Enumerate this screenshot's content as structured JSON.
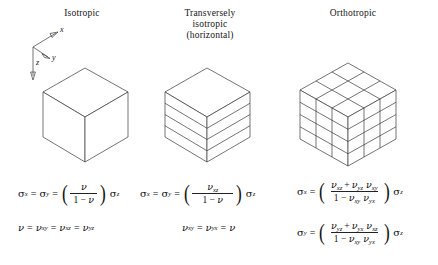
{
  "figure": {
    "columns": [
      {
        "id": "isotropic",
        "title": "Isotropic",
        "cube_style": "solid",
        "equations": [
          {
            "id": "iso-eq1",
            "lhs1": "σ",
            "lhs1_sub": "x",
            "eq1": "=",
            "lhs2": "σ",
            "lhs2_sub": "y",
            "eq2": "=",
            "open_paren": "(",
            "numerator": "ν",
            "numerator_sub": "",
            "denominator_pre": "1 − ",
            "denominator": "ν",
            "denominator_sub": "",
            "close_paren": ")",
            "rhs": "σ",
            "rhs_sub": "z"
          },
          {
            "id": "iso-eq2",
            "text_parts": [
              "ν",
              "=",
              "ν",
              "xy",
              "=",
              "ν",
              "xz",
              "=",
              "ν",
              "yz"
            ]
          }
        ]
      },
      {
        "id": "transversely-isotropic",
        "title": "Transversely\nisotropic\n(horizontal)",
        "title_line1": "Transversely",
        "title_line2": "isotropic",
        "title_line3": "(horizontal)",
        "cube_style": "layered",
        "layers": 4,
        "equations": [
          {
            "id": "trans-eq1",
            "lhs1": "σ",
            "lhs1_sub": "x",
            "eq1": "=",
            "lhs2": "σ",
            "lhs2_sub": "y",
            "eq2": "=",
            "open_paren": "(",
            "numerator": "ν",
            "numerator_sub": "xz",
            "denominator_pre": "1 − ",
            "denominator": "ν",
            "denominator_sub": "",
            "close_paren": ")",
            "rhs": "σ",
            "rhs_sub": "z"
          },
          {
            "id": "trans-eq2",
            "text_parts": [
              "ν",
              "xy",
              "=",
              "ν",
              "yx",
              "=",
              "ν"
            ]
          }
        ]
      },
      {
        "id": "orthotropic",
        "title": "Orthotropic",
        "cube_style": "gridded",
        "equations": [
          {
            "id": "ortho-eq1",
            "lhs1": "σ",
            "lhs1_sub": "x",
            "eq1": "=",
            "open_paren": "(",
            "num_a": "ν",
            "num_a_sub": "xz",
            "num_plus": "+",
            "num_b": "ν",
            "num_b_sub": "yz",
            "num_c": "ν",
            "num_c_sub": "xy",
            "den_pre": "1 − ",
            "den_a": "ν",
            "den_a_sub": "xy",
            "den_b": "ν",
            "den_b_sub": "yx",
            "close_paren": ")",
            "rhs": "σ",
            "rhs_sub": "z"
          },
          {
            "id": "ortho-eq2",
            "lhs1": "σ",
            "lhs1_sub": "y",
            "eq1": "=",
            "open_paren": "(",
            "num_a": "ν",
            "num_a_sub": "yz",
            "num_plus": "+",
            "num_b": "ν",
            "num_b_sub": "yx",
            "num_c": "ν",
            "num_c_sub": "xz",
            "den_pre": "1 − ",
            "den_a": "ν",
            "den_a_sub": "xy",
            "den_b": "ν",
            "den_b_sub": "yx",
            "close_paren": ")",
            "rhs": "σ",
            "rhs_sub": "z"
          }
        ]
      }
    ],
    "axes": {
      "x_label": "x",
      "y_label": "y",
      "z_label": "z"
    },
    "colors": {
      "background": "#ffffff",
      "line": "#3a3a3a",
      "text": "#151515"
    }
  }
}
